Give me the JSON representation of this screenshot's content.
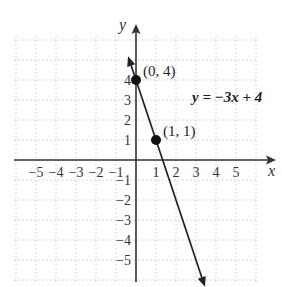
{
  "chart_data": {
    "type": "line",
    "title": "",
    "xlabel": "x",
    "ylabel": "y",
    "xlim": [
      -6,
      6
    ],
    "ylim": [
      -6,
      6
    ],
    "grid": true,
    "x_ticks": [
      "-5",
      "-4",
      "-3",
      "-2",
      "-1",
      "1",
      "2",
      "3",
      "4",
      "5"
    ],
    "y_ticks": [
      "5",
      "4",
      "3",
      "2",
      "1",
      "-1",
      "-2",
      "-3",
      "-4",
      "-5"
    ],
    "series": [
      {
        "name": "y = -3x + 4",
        "equation": "y = −3x + 4",
        "slope": -3,
        "intercept": 4,
        "x": [
          -0.35,
          3.4
        ],
        "y": [
          5.05,
          -6.2
        ]
      }
    ],
    "points": [
      {
        "label": "(0, 4)",
        "x": 0,
        "y": 4
      },
      {
        "label": "(1, 1)",
        "x": 1,
        "y": 1
      }
    ],
    "annotations": [
      "y = −3x + 4",
      "(0, 4)",
      "(1, 1)"
    ]
  }
}
